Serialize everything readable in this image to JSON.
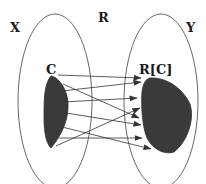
{
  "diagram": {
    "type": "set-relation-mapping",
    "labels": {
      "domain_set": "X",
      "relation": "R",
      "codomain_set": "Y",
      "subset": "C",
      "image": "R[C]"
    },
    "colors": {
      "outline": "#555555",
      "region_fill": "#3a3a3a",
      "arrow": "#333333",
      "background": "#ffffff"
    },
    "arrows": [
      {
        "from": [
          58,
          75
        ],
        "to": [
          141,
          78
        ]
      },
      {
        "from": [
          62,
          88
        ],
        "to": [
          141,
          82
        ]
      },
      {
        "from": [
          63,
          87
        ],
        "to": [
          139,
          110
        ]
      },
      {
        "from": [
          63,
          101
        ],
        "to": [
          137,
          98
        ]
      },
      {
        "from": [
          60,
          112
        ],
        "to": [
          141,
          123
        ]
      },
      {
        "from": [
          56,
          144
        ],
        "to": [
          140,
          108
        ]
      },
      {
        "from": [
          59,
          132
        ],
        "to": [
          142,
          139
        ]
      },
      {
        "from": [
          59,
          138
        ],
        "to": [
          141,
          138
        ]
      },
      {
        "from": [
          62,
          128
        ],
        "to": [
          151,
          149
        ]
      }
    ]
  }
}
